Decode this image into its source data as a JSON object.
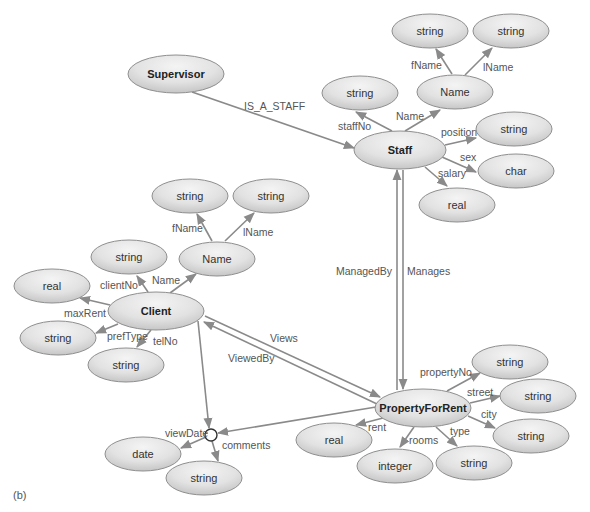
{
  "caption": "(b)",
  "colors": {
    "node_fill_light": "#f2f2f2",
    "node_fill_dark": "#c8c8c8",
    "edge": "#8a8a8a",
    "node_stroke": "#8f8f8f"
  },
  "nodes": {
    "supervisor": "Supervisor",
    "staff": "Staff",
    "staff_name": "Name",
    "staff_fname_type": "string",
    "staff_lname_type": "string",
    "staff_staffno_type": "string",
    "staff_position_type": "string",
    "staff_sex_type": "char",
    "staff_salary_type": "real",
    "client": "Client",
    "client_name": "Name",
    "client_fname_type": "string",
    "client_lname_type": "string",
    "client_clientno_type": "string",
    "client_maxrent_type": "real",
    "client_preftype_type": "string",
    "client_telno_type": "string",
    "property": "PropertyForRent",
    "property_propertyno_type": "string",
    "property_street_type": "string",
    "property_city_type": "string",
    "property_rent_type": "real",
    "property_rooms_type": "integer",
    "property_type_type": "string",
    "view_date_type": "date",
    "view_comments_type": "string"
  },
  "edges": {
    "is_a_staff": "IS_A_STAFF",
    "staff_fname": "fName",
    "staff_lname": "lName",
    "staff_name": "Name",
    "staff_staffno": "staffNo",
    "staff_position": "position",
    "staff_sex": "sex",
    "staff_salary": "salary",
    "managed_by": "ManagedBy",
    "manages": "Manages",
    "client_fname": "fName",
    "client_lname": "lName",
    "client_name": "Name",
    "client_clientno": "clientNo",
    "client_maxrent": "maxRent",
    "client_preftype": "prefType",
    "client_telno": "telNo",
    "views": "Views",
    "viewed_by": "ViewedBy",
    "property_propertyno": "propertyNo",
    "property_street": "street",
    "property_city": "city",
    "property_rent": "rent",
    "property_rooms": "rooms",
    "property_type": "type",
    "view_date": "viewDate",
    "view_comments": "comments"
  }
}
